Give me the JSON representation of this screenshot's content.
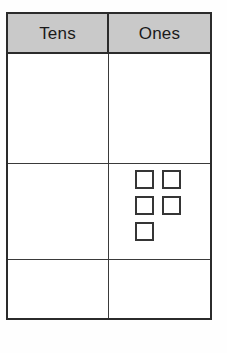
{
  "worksheet": {
    "type": "place-value-chart",
    "table": {
      "columns": [
        {
          "id": "tens",
          "label": "Tens"
        },
        {
          "id": "ones",
          "label": "Ones"
        }
      ],
      "header_background": "#c9c9c9",
      "border_color": "#2b2b2b",
      "rows": [
        {
          "id": "row-1",
          "tens": "",
          "ones": "",
          "ones_blocks": 0
        },
        {
          "id": "row-2",
          "tens": "",
          "ones": "",
          "ones_blocks": 5
        },
        {
          "id": "row-3",
          "tens": "",
          "ones": "",
          "ones_blocks": 0
        }
      ]
    },
    "blocks": {
      "shape": "unit-square",
      "count": 5,
      "arrangement": "2-2-1",
      "fill": "#ffffff",
      "stroke": "#353535"
    }
  }
}
